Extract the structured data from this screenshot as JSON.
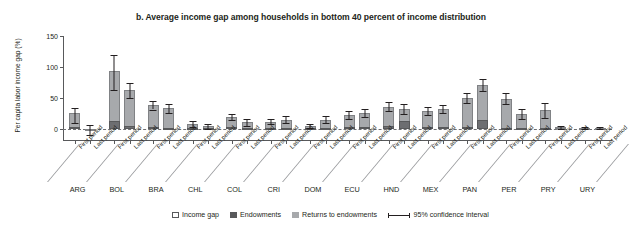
{
  "chart_data": {
    "type": "bar",
    "title": "b. Average income gap among households in bottom 40 percent of income distribution",
    "xlabel": "",
    "ylabel": "Per capita labor income gap (%)",
    "ylim": [
      -20,
      150
    ],
    "yticks": [
      0,
      50,
      100,
      150
    ],
    "ytick_labels": [
      "0",
      "50",
      "100",
      "150"
    ],
    "grid": false,
    "legend_position": "bottom",
    "countries": [
      "ARG",
      "BOL",
      "BRA",
      "CHL",
      "COL",
      "CRI",
      "DOM",
      "ECU",
      "HND",
      "MEX",
      "PAN",
      "PER",
      "PRY",
      "URY"
    ],
    "periods": [
      "First period",
      "Last period"
    ],
    "categories": [
      "ARG First period",
      "ARG Last period",
      "BOL First period",
      "BOL Last period",
      "BRA First period",
      "BRA Last period",
      "CHL First period",
      "CHL Last period",
      "COL First period",
      "COL Last period",
      "CRI First period",
      "CRI Last period",
      "DOM First period",
      "DOM Last period",
      "ECU First period",
      "ECU Last period",
      "HND First period",
      "HND Last period",
      "MEX First period",
      "MEX Last period",
      "PAN First period",
      "PAN Last period",
      "PER First period",
      "PER Last period",
      "PRY First period",
      "PRY Last period",
      "URY First period",
      "URY Last period"
    ],
    "series": [
      {
        "name": "Endowments",
        "color": "#6d6e71",
        "values": [
          2,
          0,
          12,
          4,
          2,
          1,
          1,
          1,
          3,
          1,
          1,
          1,
          1,
          1,
          2,
          2,
          4,
          12,
          2,
          2,
          2,
          14,
          1,
          1,
          1,
          0,
          0,
          0
        ]
      },
      {
        "name": "Returns to endowments",
        "color": "#a7a9ac",
        "values": [
          24,
          -2,
          81,
          58,
          36,
          32,
          7,
          3,
          16,
          9,
          10,
          13,
          3,
          13,
          20,
          23,
          31,
          20,
          26,
          30,
          47,
          56,
          47,
          22,
          29,
          2,
          1,
          1
        ]
      }
    ],
    "total_values": [
      26,
      -2,
      93,
      62,
      38,
      33,
      8,
      4,
      19,
      10,
      11,
      14,
      4,
      14,
      22,
      25,
      35,
      32,
      28,
      32,
      49,
      70,
      48,
      23,
      30,
      2,
      1,
      1
    ],
    "ci_low": [
      9,
      -10,
      62,
      50,
      31,
      26,
      3,
      0,
      14,
      5,
      7,
      9,
      1,
      9,
      15,
      19,
      28,
      24,
      22,
      26,
      41,
      61,
      40,
      15,
      18,
      -1,
      -1,
      -1
    ],
    "ci_high": [
      34,
      6,
      119,
      74,
      44,
      40,
      13,
      8,
      24,
      16,
      16,
      20,
      8,
      20,
      29,
      32,
      43,
      40,
      35,
      39,
      57,
      80,
      57,
      32,
      42,
      5,
      3,
      3
    ],
    "annotations": []
  },
  "legend": {
    "items": [
      {
        "label": "Income gap",
        "swatch": "gap"
      },
      {
        "label": "Endowments",
        "swatch": "endowments"
      },
      {
        "label": "Returns to endowments",
        "swatch": "returns"
      },
      {
        "label": "95% confidence interval",
        "swatch": "ci"
      }
    ]
  }
}
